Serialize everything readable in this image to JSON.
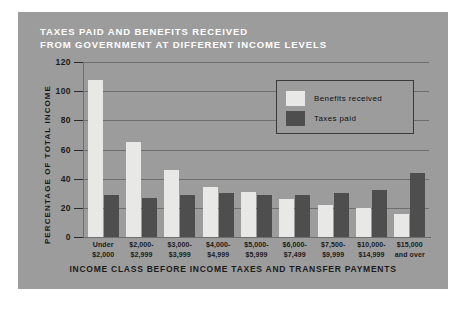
{
  "figure": {
    "title_lines": [
      "TAXES PAID AND BENEFITS RECEIVED",
      "FROM GOVERNMENT AT DIFFERENT INCOME LEVELS"
    ],
    "background_color": "#9c9c9c",
    "title_color": "#ffffff"
  },
  "legend": {
    "position": "upper-right-inside",
    "entries": [
      {
        "label": "Benefits received",
        "color": "#e8e8e6"
      },
      {
        "label": "Taxes paid",
        "color": "#4e4e4e"
      }
    ]
  },
  "chart_data": {
    "type": "bar",
    "title": "TAXES PAID AND BENEFITS RECEIVED FROM GOVERNMENT AT DIFFERENT INCOME LEVELS",
    "xlabel": "INCOME CLASS BEFORE INCOME TAXES AND TRANSFER PAYMENTS",
    "ylabel": "PERCENTAGE OF TOTAL INCOME",
    "ylim": [
      0,
      120
    ],
    "yticks": [
      0,
      20,
      40,
      60,
      80,
      100,
      120
    ],
    "ytick_labels": [
      "0",
      "20",
      "40",
      "60",
      "80",
      "100",
      "120"
    ],
    "grid": true,
    "grid_axis": "y",
    "legend_position": "upper right",
    "categories": [
      [
        "Under",
        "$2,000"
      ],
      [
        "$2,000-",
        "$2,999"
      ],
      [
        "$3,000-",
        "$3,999"
      ],
      [
        "$4,000-",
        "$4,999"
      ],
      [
        "$5,000-",
        "$5,999"
      ],
      [
        "$6,000-",
        "$7,499"
      ],
      [
        "$7,500-",
        "$9,999"
      ],
      [
        "$10,000-",
        "$14,999"
      ],
      [
        "$15,000",
        "and over"
      ]
    ],
    "series": [
      {
        "name": "Benefits received",
        "color": "#e8e8e6",
        "values": [
          108,
          65,
          46,
          34,
          31,
          26,
          22,
          20,
          16
        ]
      },
      {
        "name": "Taxes paid",
        "color": "#4e4e4e",
        "values": [
          29,
          27,
          29,
          30,
          29,
          29,
          30,
          32,
          44
        ]
      }
    ]
  }
}
